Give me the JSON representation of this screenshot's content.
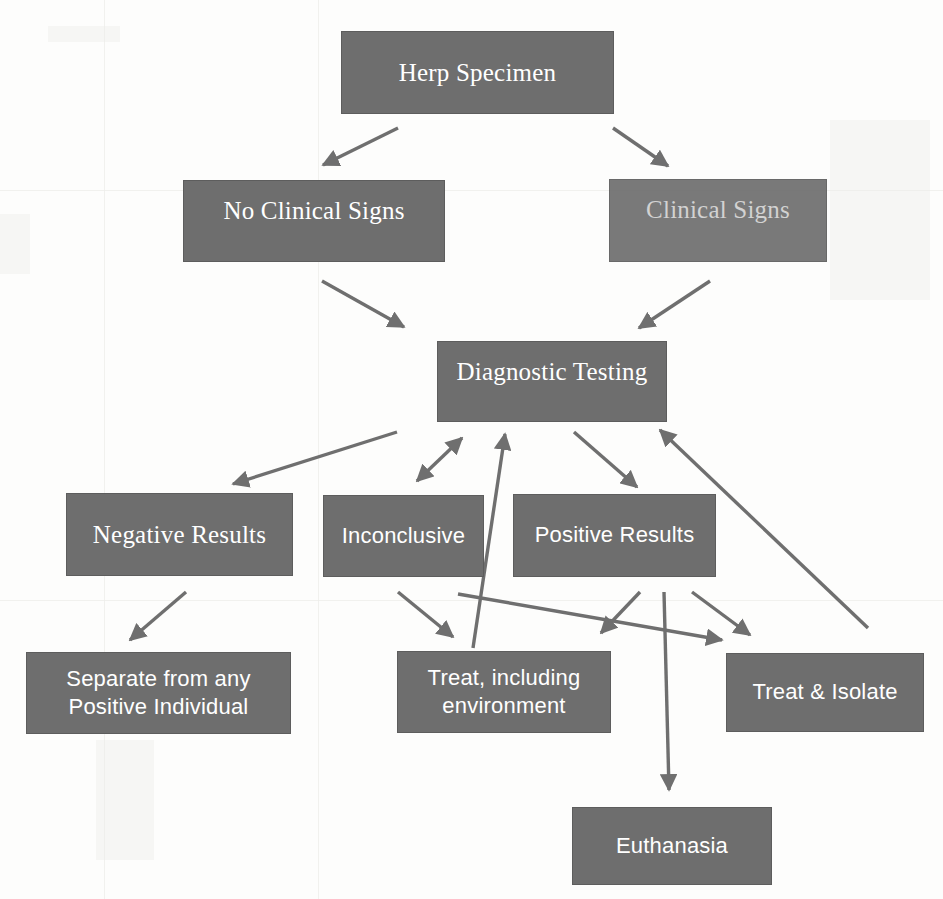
{
  "diagram": {
    "box_fill": "#6e6e6e",
    "box_border": "#5d5d5d",
    "text_color": "#ffffff",
    "arrow_color": "#6f6f6f",
    "background": "#fdfdfc"
  },
  "nodes": {
    "herp_specimen": "Herp Specimen",
    "no_clinical_signs": "No Clinical Signs",
    "clinical_signs": "Clinical Signs",
    "diagnostic_testing": "Diagnostic Testing",
    "negative_results": "Negative Results",
    "inconclusive": "Inconclusive",
    "positive_results": "Positive Results",
    "separate_from_positive": "Separate from any\nPositive Individual",
    "treat_including_environment": "Treat, including\nenvironment",
    "treat_and_isolate": "Treat & Isolate",
    "euthanasia": "Euthanasia"
  },
  "edges": [
    {
      "from": "herp_specimen",
      "to": "no_clinical_signs",
      "type": "single"
    },
    {
      "from": "herp_specimen",
      "to": "clinical_signs",
      "type": "single"
    },
    {
      "from": "no_clinical_signs",
      "to": "diagnostic_testing",
      "type": "single"
    },
    {
      "from": "clinical_signs",
      "to": "diagnostic_testing",
      "type": "single"
    },
    {
      "from": "diagnostic_testing",
      "to": "negative_results",
      "type": "single"
    },
    {
      "from": "diagnostic_testing",
      "to": "inconclusive",
      "type": "double"
    },
    {
      "from": "diagnostic_testing",
      "to": "positive_results",
      "type": "single"
    },
    {
      "from": "negative_results",
      "to": "separate_from_positive",
      "type": "single"
    },
    {
      "from": "inconclusive",
      "to": "treat_including_environment",
      "type": "single"
    },
    {
      "from": "treat_including_environment",
      "to": "diagnostic_testing",
      "type": "single"
    },
    {
      "from": "positive_results",
      "to": "treat_and_isolate",
      "type": "single"
    },
    {
      "from": "positive_results",
      "to": "euthanasia",
      "type": "single"
    },
    {
      "from": "positive_results",
      "to": "treat_including_environment",
      "type": "single"
    },
    {
      "from": "inconclusive",
      "to": "treat_and_isolate",
      "type": "single"
    },
    {
      "from": "treat_and_isolate",
      "to": "diagnostic_testing",
      "type": "single"
    }
  ]
}
